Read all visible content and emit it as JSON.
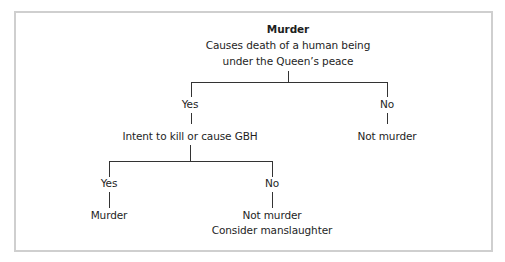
{
  "diagram": {
    "type": "decision-tree",
    "root": {
      "title": "Murder",
      "line1": "Causes death of a human being",
      "line2": "under the Queen’s peace"
    },
    "level1": {
      "yes_label": "Yes",
      "yes_node": "Intent to kill or cause GBH",
      "no_label": "No",
      "no_node": "Not murder"
    },
    "level2": {
      "yes_label": "Yes",
      "yes_node": "Murder",
      "no_label": "No",
      "no_node_line1": "Not murder",
      "no_node_line2": "Consider manslaughter"
    },
    "colors": {
      "border": "#cfcfcf",
      "line": "#333333",
      "text": "#1e1e1e"
    }
  }
}
